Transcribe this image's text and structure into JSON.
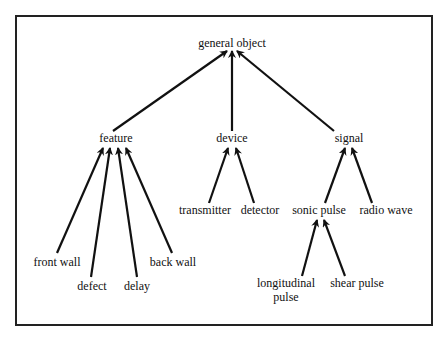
{
  "diagram": {
    "type": "hierarchy",
    "stroke_color": "#111111",
    "border_color": "#222222",
    "nodes": {
      "root": {
        "label": "general object",
        "x": 232,
        "y": 43
      },
      "feature": {
        "label": "feature",
        "x": 116,
        "y": 138
      },
      "device": {
        "label": "device",
        "x": 232,
        "y": 138
      },
      "signal": {
        "label": "signal",
        "x": 349,
        "y": 138
      },
      "transmitter": {
        "label": "transmitter",
        "x": 205,
        "y": 210
      },
      "detector": {
        "label": "detector",
        "x": 260,
        "y": 210
      },
      "sonic_pulse": {
        "label": "sonic pulse",
        "x": 319,
        "y": 210
      },
      "radio_wave": {
        "label": "radio wave",
        "x": 386,
        "y": 210
      },
      "front_wall": {
        "label": "front wall",
        "x": 57,
        "y": 262
      },
      "back_wall": {
        "label": "back wall",
        "x": 173,
        "y": 262
      },
      "defect": {
        "label": "defect",
        "x": 92,
        "y": 286
      },
      "delay": {
        "label": "delay",
        "x": 137,
        "y": 286
      },
      "longitudinal_pulse": {
        "label_line1": "longitudinal",
        "label_line2": "pulse",
        "x": 286,
        "y": 290
      },
      "shear_pulse": {
        "label": "shear pulse",
        "x": 357,
        "y": 283
      }
    },
    "edges": [
      {
        "from": "feature",
        "to": "root",
        "x1": 113,
        "y1": 131,
        "x2": 227,
        "y2": 51
      },
      {
        "from": "device",
        "to": "root",
        "x1": 232,
        "y1": 131,
        "x2": 232,
        "y2": 51
      },
      {
        "from": "signal",
        "to": "root",
        "x1": 334,
        "y1": 131,
        "x2": 237,
        "y2": 51
      },
      {
        "from": "front_wall",
        "to": "feature",
        "x1": 57,
        "y1": 253,
        "x2": 103,
        "y2": 148
      },
      {
        "from": "defect",
        "to": "feature",
        "x1": 91,
        "y1": 277,
        "x2": 110,
        "y2": 148
      },
      {
        "from": "delay",
        "to": "feature",
        "x1": 137,
        "y1": 277,
        "x2": 118,
        "y2": 148
      },
      {
        "from": "back_wall",
        "to": "feature",
        "x1": 172,
        "y1": 253,
        "x2": 126,
        "y2": 148
      },
      {
        "from": "transmitter",
        "to": "device",
        "x1": 209,
        "y1": 203,
        "x2": 228,
        "y2": 148
      },
      {
        "from": "detector",
        "to": "device",
        "x1": 254,
        "y1": 203,
        "x2": 236,
        "y2": 148
      },
      {
        "from": "sonic_pulse",
        "to": "signal",
        "x1": 325,
        "y1": 203,
        "x2": 345,
        "y2": 148
      },
      {
        "from": "radio_wave",
        "to": "signal",
        "x1": 372,
        "y1": 203,
        "x2": 352,
        "y2": 148
      },
      {
        "from": "longitudinal_pulse",
        "to": "sonic_pulse",
        "x1": 302,
        "y1": 276,
        "x2": 317,
        "y2": 220
      },
      {
        "from": "shear_pulse",
        "to": "sonic_pulse",
        "x1": 345,
        "y1": 276,
        "x2": 324,
        "y2": 220
      }
    ]
  }
}
